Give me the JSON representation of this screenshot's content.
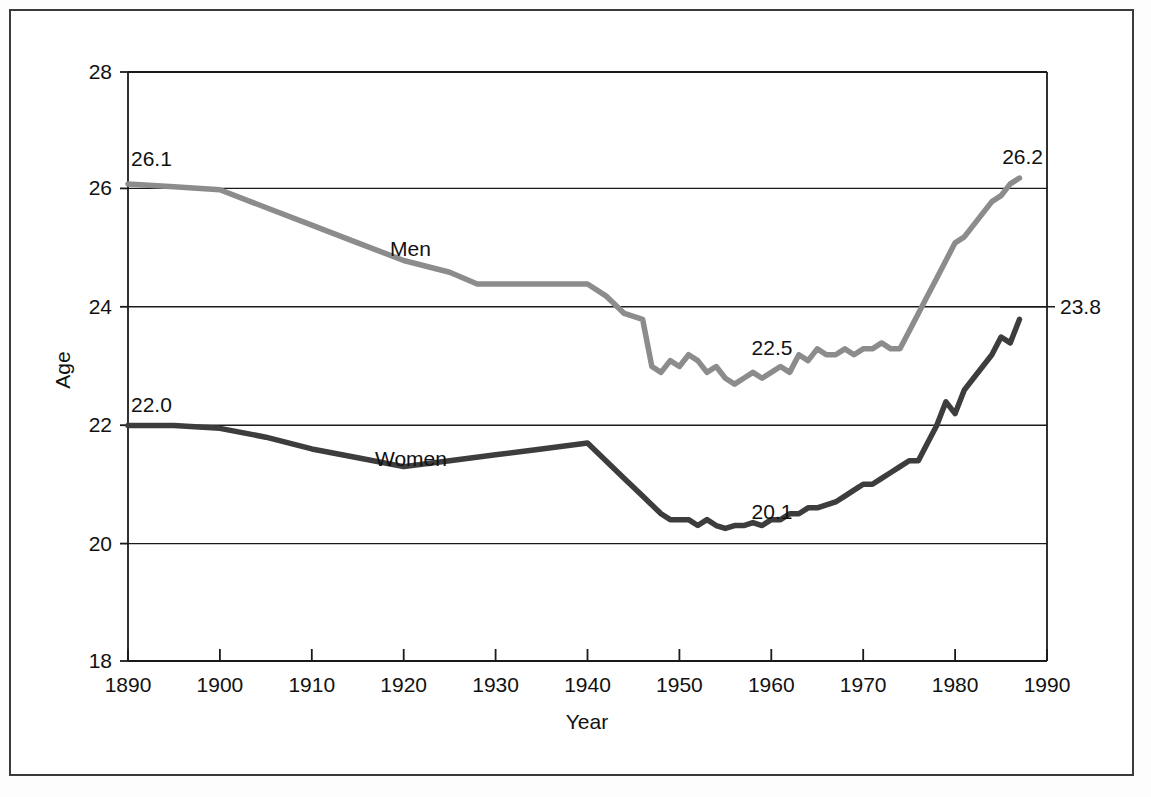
{
  "chart_data": {
    "type": "line",
    "title": "",
    "xlabel": "Year",
    "ylabel": "Age",
    "xlim": [
      1890,
      1990
    ],
    "ylim": [
      18,
      28
    ],
    "grid": "horizontal",
    "legend": "inline-labels",
    "x_ticks": [
      "1890",
      "1900",
      "1910",
      "1920",
      "1930",
      "1940",
      "1950",
      "1960",
      "1970",
      "1980",
      "1990"
    ],
    "y_ticks": [
      "18",
      "20",
      "22",
      "24",
      "26",
      "28"
    ],
    "series": [
      {
        "name": "Men",
        "color": "#8c8c8c",
        "label_position": "on-curve",
        "x": [
          1890,
          1895,
          1900,
          1905,
          1910,
          1915,
          1920,
          1925,
          1928,
          1930,
          1935,
          1940,
          1942,
          1944,
          1946,
          1947,
          1948,
          1949,
          1950,
          1951,
          1952,
          1953,
          1954,
          1955,
          1956,
          1957,
          1958,
          1959,
          1960,
          1961,
          1962,
          1963,
          1964,
          1965,
          1966,
          1967,
          1968,
          1969,
          1970,
          1971,
          1972,
          1973,
          1974,
          1975,
          1976,
          1977,
          1978,
          1979,
          1980,
          1981,
          1982,
          1983,
          1984,
          1985,
          1986,
          1987
        ],
        "values": [
          26.1,
          26.05,
          26.0,
          25.7,
          25.4,
          25.1,
          24.8,
          24.6,
          24.4,
          24.4,
          24.4,
          24.4,
          24.2,
          23.9,
          23.8,
          23.0,
          22.9,
          23.1,
          23.0,
          23.2,
          23.1,
          22.9,
          23.0,
          22.8,
          22.7,
          22.8,
          22.9,
          22.8,
          22.9,
          23.0,
          22.9,
          23.2,
          23.1,
          23.3,
          23.2,
          23.2,
          23.3,
          23.2,
          23.3,
          23.3,
          23.4,
          23.3,
          23.3,
          23.6,
          23.9,
          24.2,
          24.5,
          24.8,
          25.1,
          25.2,
          25.4,
          25.6,
          25.8,
          25.9,
          26.1,
          26.2
        ],
        "annotations": [
          {
            "text": "26.1",
            "x": 1890,
            "y": 26.1,
            "placement": "above-left-start"
          },
          {
            "text": "22.5",
            "x": 1957,
            "y": 22.5,
            "placement": "above-curve-middle"
          },
          {
            "text": "26.2",
            "x": 1987,
            "y": 26.2,
            "placement": "above-right-end"
          }
        ]
      },
      {
        "name": "Women",
        "color": "#3d3d3d",
        "label_position": "on-curve",
        "x": [
          1890,
          1895,
          1900,
          1905,
          1910,
          1915,
          1920,
          1925,
          1930,
          1935,
          1940,
          1942,
          1944,
          1946,
          1948,
          1949,
          1950,
          1951,
          1952,
          1953,
          1954,
          1955,
          1956,
          1957,
          1958,
          1959,
          1960,
          1961,
          1962,
          1963,
          1964,
          1965,
          1966,
          1967,
          1968,
          1969,
          1970,
          1971,
          1972,
          1973,
          1974,
          1975,
          1976,
          1977,
          1978,
          1979,
          1980,
          1981,
          1982,
          1983,
          1984,
          1985,
          1986,
          1987
        ],
        "values": [
          22.0,
          22.0,
          21.95,
          21.8,
          21.6,
          21.45,
          21.3,
          21.4,
          21.5,
          21.6,
          21.7,
          21.4,
          21.1,
          20.8,
          20.5,
          20.4,
          20.4,
          20.4,
          20.3,
          20.4,
          20.3,
          20.25,
          20.3,
          20.3,
          20.35,
          20.3,
          20.4,
          20.4,
          20.5,
          20.5,
          20.6,
          20.6,
          20.65,
          20.7,
          20.8,
          20.9,
          21.0,
          21.0,
          21.1,
          21.2,
          21.3,
          21.4,
          21.4,
          21.7,
          22.0,
          22.4,
          22.2,
          22.6,
          22.8,
          23.0,
          23.2,
          23.5,
          23.4,
          23.8
        ],
        "annotations": [
          {
            "text": "22.0",
            "x": 1890,
            "y": 22.0,
            "placement": "above-left-start"
          },
          {
            "text": "20.1",
            "x": 1957,
            "y": 20.1,
            "placement": "above-curve-middle"
          },
          {
            "text": "23.8",
            "x": 1987,
            "y": 23.8,
            "placement": "right-end"
          }
        ]
      }
    ]
  },
  "axes": {
    "y_axis_title": "Age",
    "x_axis_title": "Year"
  },
  "labels": {
    "men": "Men",
    "women": "Women",
    "men_start": "26.1",
    "men_mid": "22.5",
    "men_end": "26.2",
    "women_start": "22.0",
    "women_mid": "20.1",
    "women_end": "23.8"
  },
  "colors": {
    "men_line": "#8c8c8c",
    "women_line": "#3d3d3d",
    "axis": "#1a1a1a",
    "frame": "#3a3a3a",
    "background": "#ffffff"
  }
}
